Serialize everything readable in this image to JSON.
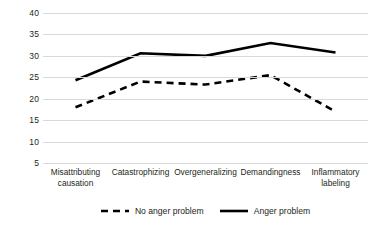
{
  "chart_data": {
    "type": "line",
    "title": "",
    "subtitle": "",
    "xlabel": "",
    "ylabel": "",
    "categories": [
      "Misattributing causation",
      "Catastrophizing",
      "Overgeneralizing",
      "Demandingness",
      "Inflammatory labeling"
    ],
    "series": [
      {
        "name": "No anger problem",
        "style": "dashed",
        "color": "#000000",
        "values": [
          18.0,
          24.0,
          23.3,
          25.5,
          17.0
        ]
      },
      {
        "name": "Anger problem",
        "style": "solid",
        "color": "#000000",
        "values": [
          24.3,
          30.6,
          30.0,
          33.0,
          30.8
        ]
      }
    ],
    "ylim": [
      5,
      40
    ],
    "yticks": [
      40,
      35,
      30,
      25,
      20,
      15,
      10,
      5
    ],
    "ytick_labels": [
      "40",
      "35",
      "30",
      "25",
      "20",
      "15",
      "10",
      "5"
    ],
    "grid": "horizontal",
    "gridline_color": "#d9d9d9",
    "legend_position": "bottom"
  },
  "legend": {
    "entries": [
      {
        "label": "No anger problem",
        "style": "dashed"
      },
      {
        "label": "Anger problem",
        "style": "solid"
      }
    ]
  },
  "axis": {
    "y_label_0": "40",
    "y_label_1": "35",
    "y_label_2": "30",
    "y_label_3": "25",
    "y_label_4": "20",
    "y_label_5": "15",
    "y_label_6": "10",
    "y_label_7": "5"
  }
}
